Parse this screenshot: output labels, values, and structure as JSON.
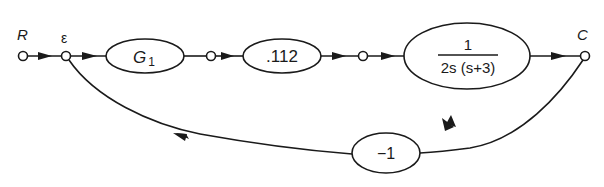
{
  "diagram": {
    "type": "signal-flow-graph",
    "nodes": {
      "input": {
        "label": "R"
      },
      "error": {
        "label": "ε"
      },
      "output": {
        "label": "C"
      }
    },
    "blocks": {
      "g1": {
        "label": "G",
        "subscript": "1"
      },
      "gain": {
        "label": ".112"
      },
      "plant": {
        "numerator": "1",
        "denominator": "2s (s+3)"
      },
      "feedback": {
        "label": "−1"
      }
    },
    "colors": {
      "stroke": "#1a1a1a",
      "background": "#ffffff"
    }
  }
}
